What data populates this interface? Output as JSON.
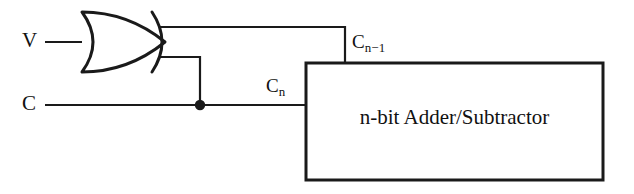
{
  "diagram": {
    "background_color": "#ffffff",
    "line_color": "#1a1a1a",
    "text_color": "#111111"
  },
  "inputs": {
    "v": {
      "label": "V",
      "wire_y": 42
    },
    "c": {
      "label": "C",
      "wire_y": 105
    }
  },
  "gate": {
    "type": "xor-gate",
    "name": "XOR",
    "x": 75,
    "y": 12,
    "width": 92,
    "height": 60
  },
  "wires": {
    "carry_out": {
      "label_base": "C",
      "label_sub": "n",
      "full": "Cn"
    },
    "carry_in": {
      "label_base": "C",
      "label_sub": "n−1",
      "full": "Cn-1"
    },
    "junction_dot": {
      "x": 200,
      "y": 105
    }
  },
  "block": {
    "label": "n-bit Adder/Subtractor",
    "x": 306,
    "y": 63,
    "width": 297,
    "height": 117
  }
}
